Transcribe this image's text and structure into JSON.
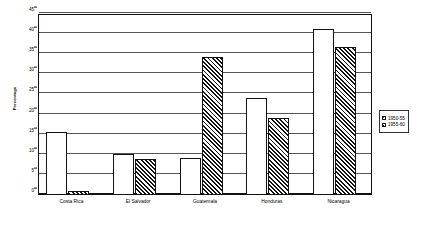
{
  "chart_data": {
    "type": "bar",
    "title": "",
    "subtitle": "",
    "xlabel": "",
    "ylabel": "Percentage",
    "ylim": [
      0,
      45
    ],
    "ytick_step": 5,
    "yticks": [
      0,
      5,
      10,
      15,
      20,
      25,
      30,
      35,
      40,
      45
    ],
    "ytick_labels": [
      "0",
      "5",
      "10",
      "15",
      "20",
      "25",
      "30",
      "35",
      "40",
      "45"
    ],
    "grid": true,
    "grid_axis": "y",
    "legend_position": "right",
    "categories": [
      "Costa Rica",
      "El Salvador",
      "Guatemala",
      "Honduras",
      "Nicaragua"
    ],
    "series": [
      {
        "name": "1950-55",
        "pattern": "dotted",
        "color": "#ffffff",
        "values": [
          15.7,
          10.1,
          9.1,
          24.2,
          41.3
        ]
      },
      {
        "name": "1955-60",
        "pattern": "diagonal-hatch",
        "color": "#111111",
        "values": [
          1.0,
          9.0,
          34.2,
          19.2,
          36.9
        ]
      }
    ]
  },
  "legend": {
    "items": [
      {
        "label": "1950-55"
      },
      {
        "label": "1955-60"
      }
    ]
  }
}
